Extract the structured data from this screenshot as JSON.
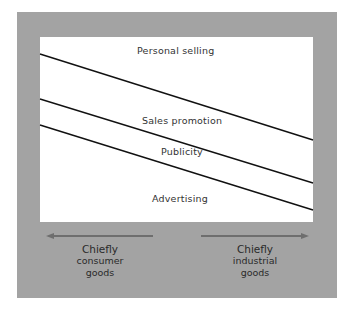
{
  "diagram": {
    "regions": [
      {
        "label": "Personal selling"
      },
      {
        "label": "Sales promotion"
      },
      {
        "label": "Publicity"
      },
      {
        "label": "Advertising"
      }
    ],
    "dividers": [
      {
        "from": [
          40,
          54
        ],
        "to": [
          313,
          140
        ]
      },
      {
        "from": [
          40,
          99
        ],
        "to": [
          313,
          183
        ]
      },
      {
        "from": [
          40,
          125
        ],
        "to": [
          313,
          210
        ]
      }
    ],
    "axis": {
      "left": {
        "line1": "Chiefly",
        "line2": "consumer",
        "line3": "goods"
      },
      "right": {
        "line1": "Chiefly",
        "line2": "industrial",
        "line3": "goods"
      }
    },
    "colors": {
      "frame": "#a3a3a3",
      "panel": "#ffffff",
      "line": "#111111",
      "arrow": "#6e6e6e"
    }
  }
}
